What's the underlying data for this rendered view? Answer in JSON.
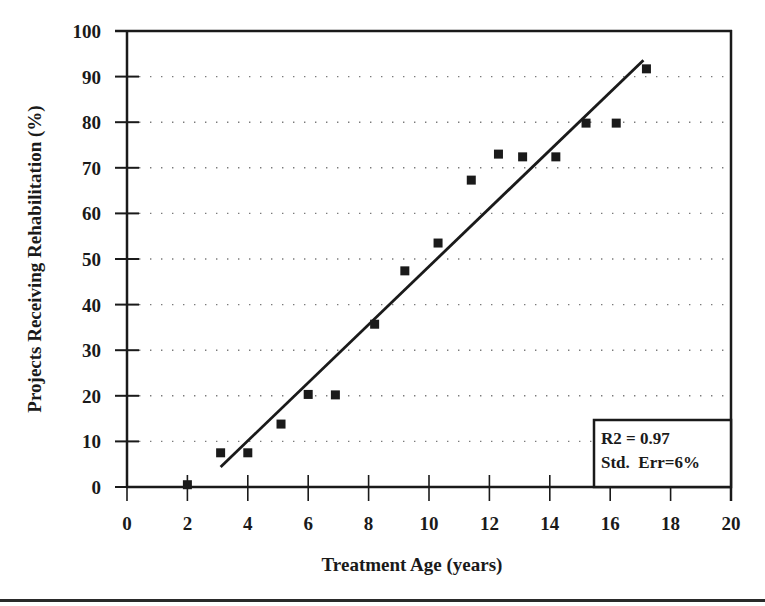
{
  "chart_data": {
    "type": "scatter",
    "title": "",
    "xlabel": "Treatment Age (years)",
    "ylabel": "Projects Receiving Rehabilitation (%)",
    "xlim": [
      0,
      20
    ],
    "ylim": [
      0,
      100
    ],
    "x_ticks": [
      0,
      2,
      4,
      6,
      8,
      10,
      12,
      14,
      16,
      18,
      20
    ],
    "y_ticks": [
      0,
      10,
      20,
      30,
      40,
      50,
      60,
      70,
      80,
      90,
      100
    ],
    "grid": {
      "horizontal": true,
      "vertical": false,
      "style": "dotted"
    },
    "series": [
      {
        "name": "Observed",
        "marker": "square",
        "points": [
          {
            "x": 2.0,
            "y": 0.5
          },
          {
            "x": 3.1,
            "y": 7.5
          },
          {
            "x": 4.0,
            "y": 7.5
          },
          {
            "x": 5.1,
            "y": 13.8
          },
          {
            "x": 6.0,
            "y": 20.3
          },
          {
            "x": 6.9,
            "y": 20.2
          },
          {
            "x": 8.2,
            "y": 35.7
          },
          {
            "x": 9.2,
            "y": 47.4
          },
          {
            "x": 10.3,
            "y": 53.5
          },
          {
            "x": 11.4,
            "y": 67.3
          },
          {
            "x": 12.3,
            "y": 73.0
          },
          {
            "x": 13.1,
            "y": 72.4
          },
          {
            "x": 14.2,
            "y": 72.4
          },
          {
            "x": 15.2,
            "y": 79.8
          },
          {
            "x": 16.2,
            "y": 79.8
          },
          {
            "x": 17.2,
            "y": 91.7
          }
        ]
      },
      {
        "name": "Linear fit",
        "type": "line",
        "points": [
          {
            "x": 3.1,
            "y": 4.4
          },
          {
            "x": 17.1,
            "y": 93.6
          }
        ]
      }
    ],
    "annotations": [
      "R2 = 0.97",
      "Std.  Err=6%"
    ],
    "legend": "none"
  },
  "colors": {
    "ink": "#1a1a1a",
    "grid": "#7a7a7a",
    "background": "#ffffff"
  }
}
